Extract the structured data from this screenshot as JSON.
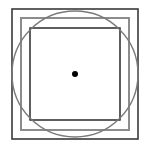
{
  "diagram": {
    "colors": {
      "background": "#ffffff",
      "outer_square": "#3a3a3a",
      "middle_square": "#8c8c8c",
      "inner_square": "#1a1a1a",
      "circle": "#7a7a7a",
      "center_dot": "#000000"
    },
    "shapes": {
      "outer_square": {
        "x": 12,
        "y": 9,
        "width": 126,
        "height": 130,
        "stroke_width": 1.6
      },
      "middle_square": {
        "x": 21,
        "y": 18,
        "width": 108,
        "height": 112,
        "stroke_width": 2
      },
      "inner_square": {
        "x": 30,
        "y": 28,
        "width": 90,
        "height": 92,
        "stroke_width": 1.4
      },
      "circle": {
        "cx": 75,
        "cy": 74,
        "r": 63,
        "stroke_width": 1.4
      },
      "center_dot": {
        "cx": 75,
        "cy": 74,
        "r": 3
      }
    }
  }
}
